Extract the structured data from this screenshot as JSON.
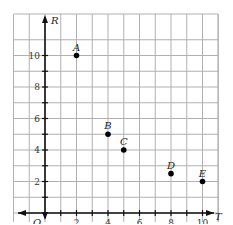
{
  "chart_data": {
    "type": "scatter",
    "title": "",
    "xlabel": "T",
    "ylabel": "R",
    "origin_label": "O",
    "xlim": [
      -2,
      11
    ],
    "ylim": [
      -2,
      11
    ],
    "grid": true,
    "x_ticks": [
      2,
      4,
      6,
      8,
      10
    ],
    "y_ticks": [
      2,
      4,
      6,
      8,
      10
    ],
    "points": [
      {
        "label": "A",
        "x": 2,
        "y": 10
      },
      {
        "label": "B",
        "x": 4,
        "y": 5
      },
      {
        "label": "C",
        "x": 5,
        "y": 4
      },
      {
        "label": "D",
        "x": 8,
        "y": 2.5
      },
      {
        "label": "E",
        "x": 10,
        "y": 2
      }
    ]
  },
  "colors": {
    "grid": "#b0b0b0",
    "axis": "#111111",
    "point": "#000000"
  }
}
